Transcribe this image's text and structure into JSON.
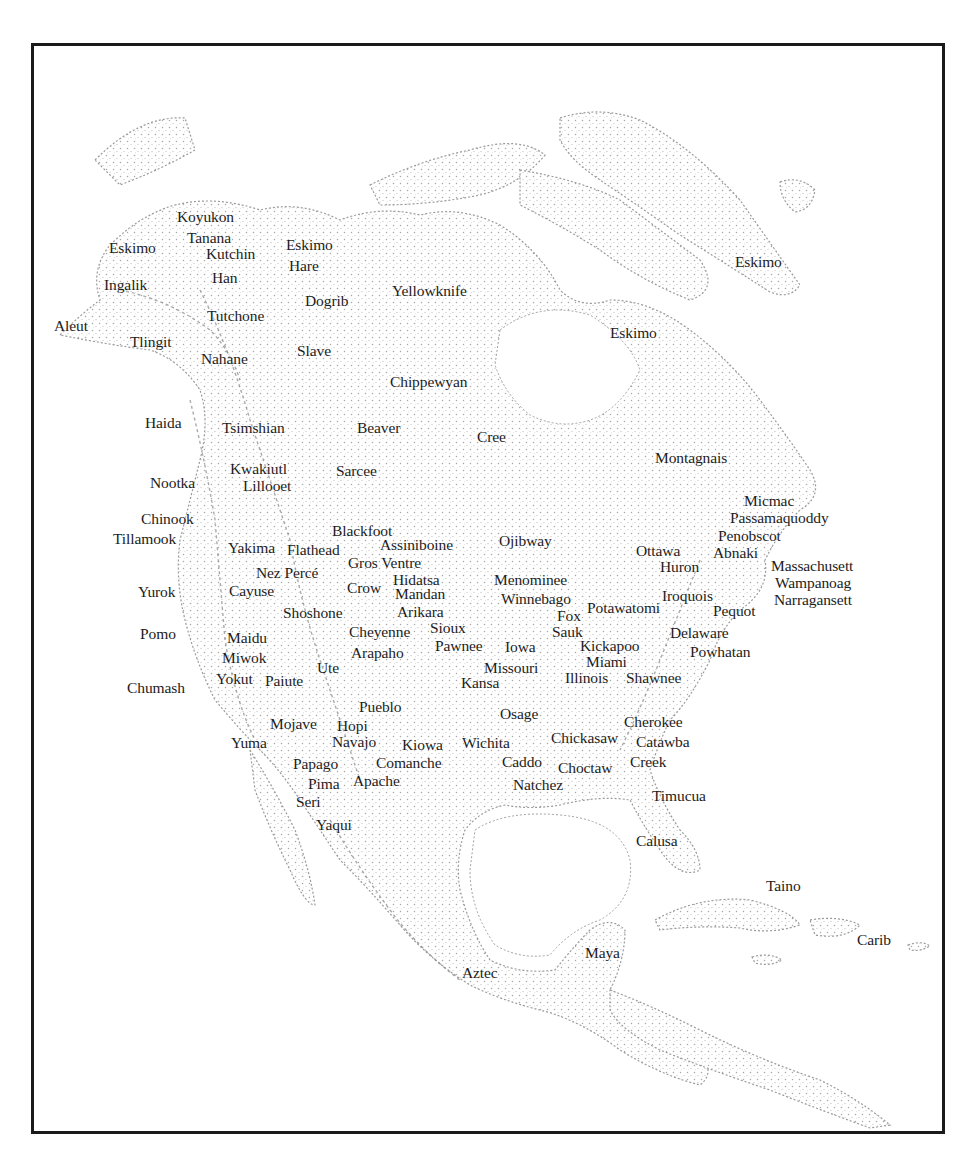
{
  "map": {
    "title_visible": false,
    "colors": {
      "frame": "#1a1a1a",
      "land_stipple": "#9a9a9a",
      "label": "#1c1c1c",
      "background": "#ffffff"
    },
    "labels": [
      {
        "text": "Koyukon",
        "x": 177,
        "y": 221
      },
      {
        "text": "Eskimo",
        "x": 109,
        "y": 252
      },
      {
        "text": "Tanana",
        "x": 187,
        "y": 242
      },
      {
        "text": "Kutchin",
        "x": 206,
        "y": 258
      },
      {
        "text": "Eskimo",
        "x": 286,
        "y": 249
      },
      {
        "text": "Hare",
        "x": 289,
        "y": 270
      },
      {
        "text": "Han",
        "x": 212,
        "y": 282
      },
      {
        "text": "Ingalik",
        "x": 104,
        "y": 289
      },
      {
        "text": "Dogrib",
        "x": 305,
        "y": 305
      },
      {
        "text": "Yellowknife",
        "x": 392,
        "y": 295
      },
      {
        "text": "Tutchone",
        "x": 207,
        "y": 320
      },
      {
        "text": "Aleut",
        "x": 54,
        "y": 330
      },
      {
        "text": "Tlingit",
        "x": 130,
        "y": 346
      },
      {
        "text": "Slave",
        "x": 297,
        "y": 355
      },
      {
        "text": "Nahane",
        "x": 201,
        "y": 363
      },
      {
        "text": "Eskimo",
        "x": 610,
        "y": 337
      },
      {
        "text": "Chippewyan",
        "x": 390,
        "y": 386
      },
      {
        "text": "Haida",
        "x": 145,
        "y": 427
      },
      {
        "text": "Tsimshian",
        "x": 222,
        "y": 432
      },
      {
        "text": "Beaver",
        "x": 357,
        "y": 432
      },
      {
        "text": "Cree",
        "x": 477,
        "y": 441
      },
      {
        "text": "Montagnais",
        "x": 655,
        "y": 462
      },
      {
        "text": "Nootka",
        "x": 150,
        "y": 487
      },
      {
        "text": "Kwakiutl",
        "x": 230,
        "y": 473
      },
      {
        "text": "Sarcee",
        "x": 336,
        "y": 475
      },
      {
        "text": "Lillooet",
        "x": 243,
        "y": 490
      },
      {
        "text": "Micmac",
        "x": 744,
        "y": 505
      },
      {
        "text": "Passamaquoddy",
        "x": 730,
        "y": 522
      },
      {
        "text": "Chinook",
        "x": 141,
        "y": 523
      },
      {
        "text": "Tillamook",
        "x": 113,
        "y": 543
      },
      {
        "text": "Blackfoot",
        "x": 332,
        "y": 535
      },
      {
        "text": "Penobscot",
        "x": 718,
        "y": 540
      },
      {
        "text": "Yakima",
        "x": 228,
        "y": 552
      },
      {
        "text": "Flathead",
        "x": 287,
        "y": 554
      },
      {
        "text": "Assiniboine",
        "x": 380,
        "y": 549
      },
      {
        "text": "Ojibway",
        "x": 499,
        "y": 545
      },
      {
        "text": "Ottawa",
        "x": 636,
        "y": 555
      },
      {
        "text": "Abnaki",
        "x": 713,
        "y": 557
      },
      {
        "text": "Gros Ventre",
        "x": 348,
        "y": 567
      },
      {
        "text": "Huron",
        "x": 660,
        "y": 571
      },
      {
        "text": "Massachusett",
        "x": 771,
        "y": 570
      },
      {
        "text": "Nez Percé",
        "x": 256,
        "y": 577
      },
      {
        "text": "Hidatsa",
        "x": 393,
        "y": 584
      },
      {
        "text": "Menominee",
        "x": 494,
        "y": 584
      },
      {
        "text": "Wampanoag",
        "x": 775,
        "y": 587
      },
      {
        "text": "Crow",
        "x": 347,
        "y": 592
      },
      {
        "text": "Mandan",
        "x": 395,
        "y": 598
      },
      {
        "text": "Cayuse",
        "x": 229,
        "y": 595
      },
      {
        "text": "Yurok",
        "x": 138,
        "y": 596
      },
      {
        "text": "Iroquois",
        "x": 662,
        "y": 600
      },
      {
        "text": "Narragansett",
        "x": 774,
        "y": 604
      },
      {
        "text": "Winnebago",
        "x": 501,
        "y": 603
      },
      {
        "text": "Fox",
        "x": 557,
        "y": 620
      },
      {
        "text": "Potawatomi",
        "x": 587,
        "y": 612
      },
      {
        "text": "Pequot",
        "x": 713,
        "y": 615
      },
      {
        "text": "Shoshone",
        "x": 283,
        "y": 617
      },
      {
        "text": "Arikara",
        "x": 397,
        "y": 616
      },
      {
        "text": "Sauk",
        "x": 552,
        "y": 636
      },
      {
        "text": "Pomo",
        "x": 140,
        "y": 638
      },
      {
        "text": "Cheyenne",
        "x": 349,
        "y": 636
      },
      {
        "text": "Sioux",
        "x": 430,
        "y": 632
      },
      {
        "text": "Delaware",
        "x": 670,
        "y": 637
      },
      {
        "text": "Maidu",
        "x": 227,
        "y": 642
      },
      {
        "text": "Kickapoo",
        "x": 580,
        "y": 650
      },
      {
        "text": "Pawnee",
        "x": 435,
        "y": 650
      },
      {
        "text": "Iowa",
        "x": 505,
        "y": 651
      },
      {
        "text": "Arapaho",
        "x": 351,
        "y": 657
      },
      {
        "text": "Miwok",
        "x": 222,
        "y": 662
      },
      {
        "text": "Powhatan",
        "x": 690,
        "y": 656
      },
      {
        "text": "Miami",
        "x": 586,
        "y": 666
      },
      {
        "text": "Ute",
        "x": 317,
        "y": 672
      },
      {
        "text": "Missouri",
        "x": 484,
        "y": 672
      },
      {
        "text": "Illinois",
        "x": 565,
        "y": 682
      },
      {
        "text": "Shawnee",
        "x": 626,
        "y": 682
      },
      {
        "text": "Yokut",
        "x": 216,
        "y": 683
      },
      {
        "text": "Paiute",
        "x": 265,
        "y": 685
      },
      {
        "text": "Kansa",
        "x": 461,
        "y": 687
      },
      {
        "text": "Chumash",
        "x": 127,
        "y": 692
      },
      {
        "text": "Pueblo",
        "x": 359,
        "y": 711
      },
      {
        "text": "Osage",
        "x": 500,
        "y": 718
      },
      {
        "text": "Mojave",
        "x": 270,
        "y": 728
      },
      {
        "text": "Hopi",
        "x": 337,
        "y": 730
      },
      {
        "text": "Cherokee",
        "x": 624,
        "y": 726
      },
      {
        "text": "Chickasaw",
        "x": 551,
        "y": 742
      },
      {
        "text": "Catawba",
        "x": 636,
        "y": 746
      },
      {
        "text": "Yuma",
        "x": 231,
        "y": 747
      },
      {
        "text": "Navajo",
        "x": 332,
        "y": 746
      },
      {
        "text": "Kiowa",
        "x": 402,
        "y": 749
      },
      {
        "text": "Wichita",
        "x": 462,
        "y": 747
      },
      {
        "text": "Papago",
        "x": 293,
        "y": 768
      },
      {
        "text": "Comanche",
        "x": 376,
        "y": 767
      },
      {
        "text": "Caddo",
        "x": 502,
        "y": 766
      },
      {
        "text": "Choctaw",
        "x": 558,
        "y": 772
      },
      {
        "text": "Creek",
        "x": 630,
        "y": 766
      },
      {
        "text": "Pima",
        "x": 308,
        "y": 788
      },
      {
        "text": "Apache",
        "x": 353,
        "y": 785
      },
      {
        "text": "Natchez",
        "x": 513,
        "y": 789
      },
      {
        "text": "Timucua",
        "x": 652,
        "y": 800
      },
      {
        "text": "Seri",
        "x": 296,
        "y": 806
      },
      {
        "text": "Yaqui",
        "x": 316,
        "y": 829
      },
      {
        "text": "Calusa",
        "x": 636,
        "y": 845
      },
      {
        "text": "Taino",
        "x": 766,
        "y": 890
      },
      {
        "text": "Eskimo",
        "x": 735,
        "y": 266
      },
      {
        "text": "Carib",
        "x": 857,
        "y": 944
      },
      {
        "text": "Maya",
        "x": 585,
        "y": 957
      },
      {
        "text": "Aztec",
        "x": 462,
        "y": 977
      }
    ]
  }
}
